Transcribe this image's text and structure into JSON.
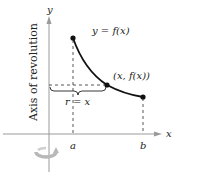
{
  "figure": {
    "axes": {
      "x_label": "x",
      "y_label": "y",
      "axis_color": "#9a9a9a"
    },
    "labels": {
      "function": "y = f(x)",
      "point": "(x, f(x))",
      "radius": "r = x",
      "axis_of_revolution": "Axis of revolution",
      "a": "a",
      "b": "b"
    },
    "colors": {
      "curve": "#111111",
      "dashed": "#444444",
      "text": "#222222",
      "rotation_icon": "#b8b8b8"
    },
    "icons": {
      "rotation": "rotation-arrow-icon"
    }
  }
}
